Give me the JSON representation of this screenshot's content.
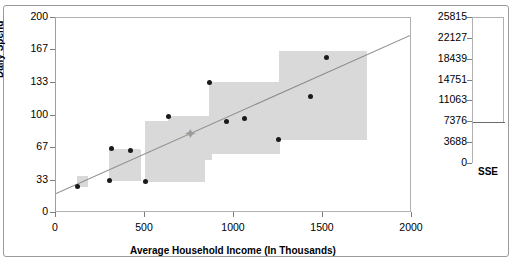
{
  "chart_data": {
    "type": "scatter",
    "title": "",
    "xlabel": "Average Household Income (In Thousands)",
    "ylabel": "Daily Spend",
    "xlim": [
      0,
      2000
    ],
    "ylim": [
      0,
      200
    ],
    "xticks": [
      "0",
      "500",
      "1000",
      "1500",
      "2000"
    ],
    "xtick_values": [
      0,
      500,
      1000,
      1500,
      2000
    ],
    "yticks": [
      "0",
      "33",
      "67",
      "100",
      "133",
      "167",
      "200"
    ],
    "ytick_values": [
      0,
      33,
      67,
      100,
      133,
      167,
      200
    ],
    "grid": false,
    "legend": "none",
    "points": [
      {
        "x": 120,
        "y": 27
      },
      {
        "x": 300,
        "y": 33
      },
      {
        "x": 310,
        "y": 66
      },
      {
        "x": 420,
        "y": 64
      },
      {
        "x": 500,
        "y": 32
      },
      {
        "x": 630,
        "y": 99
      },
      {
        "x": 860,
        "y": 134
      },
      {
        "x": 960,
        "y": 94
      },
      {
        "x": 1060,
        "y": 97
      },
      {
        "x": 1250,
        "y": 75
      },
      {
        "x": 1430,
        "y": 119
      },
      {
        "x": 1520,
        "y": 160
      }
    ],
    "residual_squares": [
      {
        "x": 120,
        "y": 27,
        "size": 11
      },
      {
        "x": 300,
        "y": 33,
        "size": 32
      },
      {
        "x": 310,
        "y": 66,
        "size": 30
      },
      {
        "x": 420,
        "y": 64,
        "size": 6
      },
      {
        "x": 500,
        "y": 32,
        "size": 62
      },
      {
        "x": 630,
        "y": 99,
        "size": 45
      },
      {
        "x": 860,
        "y": 134,
        "size": 73
      },
      {
        "x": 960,
        "y": 94,
        "size": 14
      },
      {
        "x": 1060,
        "y": 97,
        "size": 26
      },
      {
        "x": 1250,
        "y": 75,
        "size": 91
      },
      {
        "x": 1430,
        "y": 119,
        "size": 0
      },
      {
        "x": 1520,
        "y": 160,
        "size": 0
      }
    ],
    "regression_line": {
      "x0": 0,
      "y0": 21,
      "x1": 2000,
      "y1": 184
    },
    "centroid": {
      "x": 755,
      "y": 83
    },
    "sse_panel": {
      "axis_title": "SSE",
      "ticks": [
        "25815",
        "22127",
        "18439",
        "14751",
        "11063",
        "7376",
        "3688",
        "0"
      ],
      "tick_values": [
        25815,
        22127,
        18439,
        14751,
        11063,
        7376,
        3688,
        0
      ],
      "ylim": [
        0,
        25815
      ],
      "value": 7376
    }
  },
  "colors": {
    "point": "#1a1a1a",
    "square": "#d9d9d9",
    "line": "#8a8a8a",
    "frame": "#b0b0b0",
    "text": "#000000"
  }
}
